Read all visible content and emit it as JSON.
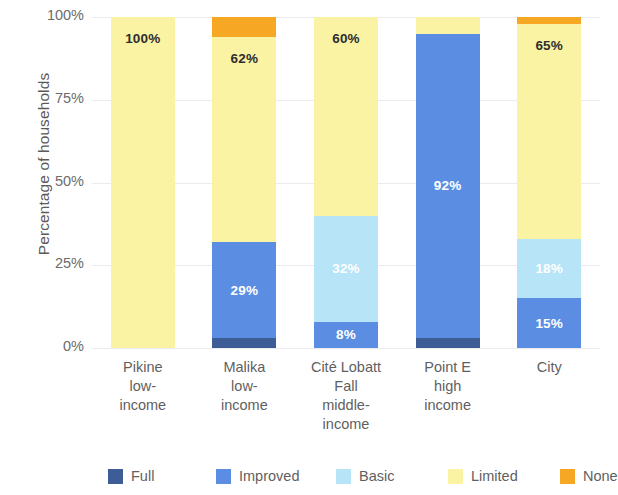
{
  "chart_data": {
    "type": "bar",
    "subtype": "stacked-bar-100",
    "title": "",
    "xlabel": "",
    "ylabel": "Percentage of households",
    "ylim": [
      0,
      100
    ],
    "ytick_labels": [
      "0%",
      "25%",
      "50%",
      "75%",
      "100%"
    ],
    "ytick_values": [
      0,
      25,
      50,
      75,
      100
    ],
    "grid": true,
    "legend_position": "bottom",
    "categories": [
      "Pikine low-income",
      "Malika low-income",
      "Cité Lobatt Fall middle-income",
      "Point E high income",
      "City"
    ],
    "category_label_lines": [
      [
        "Pikine",
        "low-",
        "income"
      ],
      [
        "Malika",
        "low-",
        "income"
      ],
      [
        "Cité Lobatt",
        "Fall",
        "middle-",
        "income"
      ],
      [
        "Point E",
        "high",
        "income"
      ],
      [
        "City"
      ]
    ],
    "series": [
      {
        "name": "Full",
        "color": "#3e5d96",
        "values": [
          0,
          3,
          0,
          3,
          0
        ],
        "labels": [
          "",
          "",
          "",
          "",
          ""
        ]
      },
      {
        "name": "Improved",
        "color": "#5b8ee2",
        "values": [
          0,
          29,
          8,
          92,
          15
        ],
        "labels": [
          "",
          "29%",
          "8%",
          "92%",
          "15%"
        ]
      },
      {
        "name": "Basic",
        "color": "#b7e4f7",
        "values": [
          0,
          0,
          32,
          0,
          18
        ],
        "labels": [
          "",
          "",
          "32%",
          "",
          "18%"
        ]
      },
      {
        "name": "Limited",
        "color": "#fbf3a4",
        "values": [
          100,
          62,
          60,
          5,
          65
        ],
        "labels": [
          "100%",
          "62%",
          "60%",
          "",
          "65%"
        ]
      },
      {
        "name": "None",
        "color": "#f6a724",
        "values": [
          0,
          6,
          0,
          0,
          2
        ],
        "labels": [
          "",
          "",
          "",
          "",
          ""
        ]
      }
    ]
  },
  "legend": {
    "items": [
      {
        "label": "Full",
        "color": "#3e5d96"
      },
      {
        "label": "Improved",
        "color": "#5b8ee2"
      },
      {
        "label": "Basic",
        "color": "#b7e4f7"
      },
      {
        "label": "Limited",
        "color": "#fbf3a4"
      },
      {
        "label": "None",
        "color": "#f6a724"
      }
    ]
  },
  "axis": {
    "y_title": "Percentage of households"
  }
}
